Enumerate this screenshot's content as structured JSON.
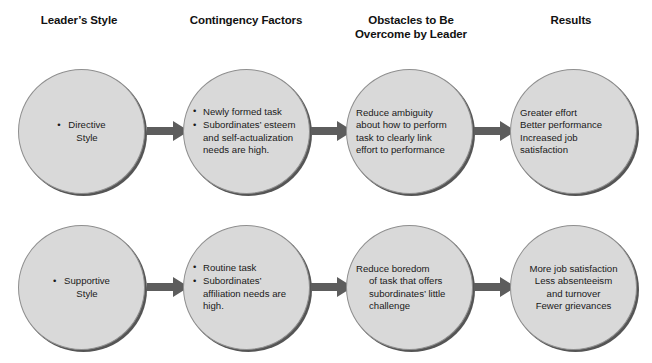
{
  "diagram": {
    "type": "flow-diagram",
    "columns": [
      {
        "id": "leaders-style",
        "label": "Leader’s Style"
      },
      {
        "id": "contingency-factors",
        "label": "Contingency Factors"
      },
      {
        "id": "obstacles",
        "label": "Obstacles to Be\nOvercome by Leader"
      },
      {
        "id": "results",
        "label": "Results"
      }
    ],
    "colors": {
      "node_fill": "#d9d9d9",
      "node_outline": "#8f8f8f",
      "node_shadow": "#555555",
      "arrow": "#5d5d5d",
      "text": "#1a1a1a",
      "background": "#ffffff"
    },
    "rows": [
      {
        "id": "row-directive",
        "nodes": [
          {
            "id": "node-directive-style",
            "style": "single-bullet",
            "line1": "Directive",
            "line2": "Style"
          },
          {
            "id": "node-contingency-1",
            "style": "bullets",
            "bullets": [
              "Newly formed task",
              "Subordinates’ esteem and self-actualization needs are high."
            ]
          },
          {
            "id": "node-obstacles-1",
            "style": "paragraph-left",
            "lines": [
              "Reduce ambiguity",
              "about how to perform",
              "task to clearly link",
              "effort to performance"
            ]
          },
          {
            "id": "node-results-1",
            "style": "paragraph-left",
            "lines": [
              "Greater effort",
              "Better performance",
              "Increased job satisfaction"
            ]
          }
        ],
        "arrows": [
          {
            "id": "arrow-directive-to-contingency",
            "label": "arrow-right"
          },
          {
            "id": "arrow-contingency-to-obstacles",
            "label": "arrow-right"
          },
          {
            "id": "arrow-obstacles-to-results",
            "label": "arrow-right"
          }
        ]
      },
      {
        "id": "row-supportive",
        "nodes": [
          {
            "id": "node-supportive-style",
            "style": "single-bullet",
            "line1": "Supportive",
            "line2": "Style"
          },
          {
            "id": "node-contingency-2",
            "style": "bullets",
            "bullets": [
              "Routine task",
              "Subordinates’ affiliation needs are high."
            ]
          },
          {
            "id": "node-obstacles-2",
            "style": "hanging-indent",
            "line1": "Reduce boredom",
            "indented": [
              "of task that offers",
              "subordinates’ little",
              "challenge"
            ]
          },
          {
            "id": "node-results-2",
            "style": "paragraph-center",
            "lines": [
              "More job satisfaction",
              "Less absenteeism",
              "and turnover",
              "Fewer grievances"
            ]
          }
        ],
        "arrows": [
          {
            "id": "arrow-supportive-to-contingency",
            "label": "arrow-right"
          },
          {
            "id": "arrow-contingency-to-obstacles-2",
            "label": "arrow-right"
          },
          {
            "id": "arrow-obstacles-to-results-2",
            "label": "arrow-right"
          }
        ]
      }
    ]
  }
}
